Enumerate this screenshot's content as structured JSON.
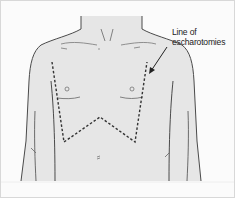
{
  "figure": {
    "annotation": {
      "line1": "Line of",
      "line2": "escharotomies"
    },
    "colors": {
      "skin": "#e6e6e6",
      "outline": "#4a4a4a",
      "dashed_line": "#333333",
      "background": "#fbfbfb",
      "border": "#d8d8d8"
    }
  }
}
